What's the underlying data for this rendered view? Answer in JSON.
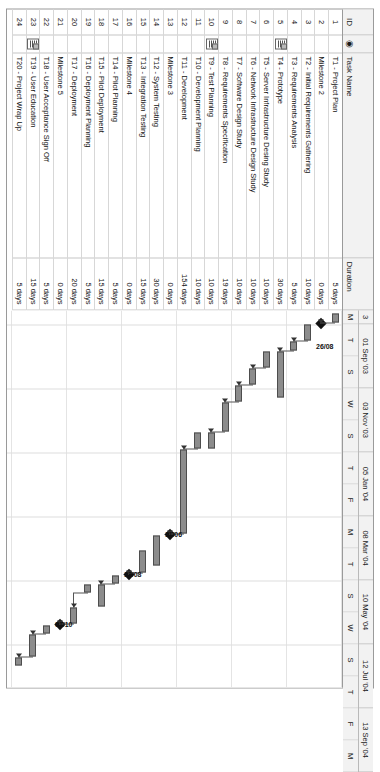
{
  "table": {
    "columns": [
      "ID",
      "indicator-icon",
      "Task Name",
      "Duration"
    ],
    "rows": [
      {
        "id": "1",
        "indicator": "",
        "name": "T1 - Project Plan",
        "duration": "5 days"
      },
      {
        "id": "2",
        "indicator": "",
        "name": "Milestone 2",
        "duration": "0 days"
      },
      {
        "id": "3",
        "indicator": "",
        "name": "T2 - Initial Requirements Gathering",
        "duration": "10 days"
      },
      {
        "id": "4",
        "indicator": "",
        "name": "T3 - Requirements Analysis",
        "duration": "5 days"
      },
      {
        "id": "5",
        "indicator": "note-icon",
        "name": "T4 - Prototype",
        "duration": "30 days"
      },
      {
        "id": "6",
        "indicator": "",
        "name": "T5 - Server Infrastructure Desing Study",
        "duration": "10 days"
      },
      {
        "id": "7",
        "indicator": "",
        "name": "T6 - Network Infrastructure Design Study",
        "duration": "10 days"
      },
      {
        "id": "8",
        "indicator": "",
        "name": "T7 - Software Design Study",
        "duration": "10 days"
      },
      {
        "id": "9",
        "indicator": "",
        "name": "T8 - Requirements Specification",
        "duration": "19 days"
      },
      {
        "id": "10",
        "indicator": "note-icon",
        "name": "T9 - Test Planning",
        "duration": "10 days"
      },
      {
        "id": "11",
        "indicator": "",
        "name": "T10 - Development Planning",
        "duration": "10 days"
      },
      {
        "id": "12",
        "indicator": "",
        "name": "T11 - Development",
        "duration": "154 days"
      },
      {
        "id": "13",
        "indicator": "",
        "name": "Milestone 3",
        "duration": "0 days"
      },
      {
        "id": "14",
        "indicator": "",
        "name": "T12 - System Testing",
        "duration": "30 days"
      },
      {
        "id": "15",
        "indicator": "",
        "name": "T13 - Integration Testing",
        "duration": "15 days"
      },
      {
        "id": "16",
        "indicator": "",
        "name": "Milestone 4",
        "duration": "0 days"
      },
      {
        "id": "17",
        "indicator": "",
        "name": "T14 - Pilot Planning",
        "duration": "5 days"
      },
      {
        "id": "18",
        "indicator": "",
        "name": "T15 - Pilot Deployment",
        "duration": "15 days"
      },
      {
        "id": "19",
        "indicator": "",
        "name": "T16 - Deployment Planning",
        "duration": "5 days"
      },
      {
        "id": "20",
        "indicator": "",
        "name": "T17 - Deployment",
        "duration": "20 days"
      },
      {
        "id": "21",
        "indicator": "",
        "name": "Milestone 5",
        "duration": "0 days"
      },
      {
        "id": "22",
        "indicator": "",
        "name": "T18 - User Acceptance Sign Off",
        "duration": "5 days"
      },
      {
        "id": "23",
        "indicator": "note-icon",
        "name": "T19 - User Education",
        "duration": "15 days"
      },
      {
        "id": "24",
        "indicator": "",
        "name": "T20 - Project Wrap Up",
        "duration": "5 days"
      }
    ]
  },
  "timescale": {
    "major": [
      {
        "label": "3",
        "width": 14
      },
      {
        "label": "01 Sep '03",
        "width": 64
      },
      {
        "label": "03 Nov '03",
        "width": 64
      },
      {
        "label": "05 Jan '04",
        "width": 64
      },
      {
        "label": "08 Mar '04",
        "width": 64
      },
      {
        "label": "10 May '04",
        "width": 64
      },
      {
        "label": "12 Jul '04",
        "width": 64
      },
      {
        "label": "13 Sep '04",
        "width": 64
      }
    ],
    "minor": [
      {
        "label": "M",
        "width": 14
      },
      {
        "label": "T",
        "width": 32
      },
      {
        "label": "S",
        "width": 32
      },
      {
        "label": "W",
        "width": 32
      },
      {
        "label": "S",
        "width": 32
      },
      {
        "label": "T",
        "width": 32
      },
      {
        "label": "F",
        "width": 32
      },
      {
        "label": "M",
        "width": 32
      },
      {
        "label": "T",
        "width": 32
      },
      {
        "label": "S",
        "width": 32
      },
      {
        "label": "W",
        "width": 32
      },
      {
        "label": "S",
        "width": 32
      },
      {
        "label": "T",
        "width": 32
      },
      {
        "label": "F",
        "width": 32
      },
      {
        "label": "M",
        "width": 32
      }
    ]
  },
  "milestone_labels": [
    {
      "text": "26/08",
      "row": 2,
      "x": 34
    },
    {
      "text": "11/06",
      "row": 13,
      "x": 222
    },
    {
      "text": "13/08",
      "row": 16,
      "x": 262
    },
    {
      "text": "01/10",
      "row": 21,
      "x": 312
    }
  ],
  "chart_data": {
    "type": "bar",
    "xlabel": "Timeline (weeks)",
    "ylabel": "Task",
    "categories": [
      "T1 - Project Plan",
      "Milestone 2",
      "T2 - Initial Requirements Gathering",
      "T3 - Requirements Analysis",
      "T4 - Prototype",
      "T5 - Server Infrastructure Desing Study",
      "T6 - Network Infrastructure Design Study",
      "T7 - Software Design Study",
      "T8 - Requirements Specification",
      "T9 - Test Planning",
      "T10 - Development Planning",
      "T11 - Development",
      "Milestone 3",
      "T12 - System Testing",
      "T13 - Integration Testing",
      "Milestone 4",
      "T14 - Pilot Planning",
      "T15 - Pilot Deployment",
      "T16 - Deployment Planning",
      "T17 - Deployment",
      "Milestone 5",
      "T18 - User Acceptance Sign Off",
      "T19 - User Education",
      "T20 - Project Wrap Up"
    ],
    "values": [
      5,
      0,
      10,
      5,
      30,
      10,
      10,
      10,
      19,
      10,
      10,
      154,
      0,
      30,
      15,
      0,
      5,
      15,
      5,
      20,
      0,
      5,
      15,
      5
    ],
    "units": "days",
    "bars": [
      {
        "row": 1,
        "start": 3,
        "len": 9,
        "kind": "task"
      },
      {
        "row": 2,
        "start": 13,
        "len": 0,
        "kind": "milestone"
      },
      {
        "row": 3,
        "start": 14,
        "len": 16,
        "kind": "task"
      },
      {
        "row": 4,
        "start": 31,
        "len": 9,
        "kind": "task"
      },
      {
        "row": 5,
        "start": 41,
        "len": 46,
        "kind": "task"
      },
      {
        "row": 6,
        "start": 41,
        "len": 16,
        "kind": "task"
      },
      {
        "row": 7,
        "start": 58,
        "len": 16,
        "kind": "task"
      },
      {
        "row": 8,
        "start": 75,
        "len": 16,
        "kind": "task"
      },
      {
        "row": 9,
        "start": 92,
        "len": 29,
        "kind": "task"
      },
      {
        "row": 10,
        "start": 122,
        "len": 16,
        "kind": "task"
      },
      {
        "row": 11,
        "start": 122,
        "len": 16,
        "kind": "task"
      },
      {
        "row": 12,
        "start": 139,
        "len": 84,
        "kind": "task"
      },
      {
        "row": 13,
        "start": 224,
        "len": 0,
        "kind": "milestone"
      },
      {
        "row": 14,
        "start": 225,
        "len": 30,
        "kind": "task"
      },
      {
        "row": 15,
        "start": 240,
        "len": 22,
        "kind": "task"
      },
      {
        "row": 16,
        "start": 264,
        "len": 0,
        "kind": "milestone"
      },
      {
        "row": 17,
        "start": 265,
        "len": 8,
        "kind": "task"
      },
      {
        "row": 18,
        "start": 274,
        "len": 22,
        "kind": "task"
      },
      {
        "row": 19,
        "start": 274,
        "len": 8,
        "kind": "task"
      },
      {
        "row": 20,
        "start": 297,
        "len": 16,
        "kind": "task"
      },
      {
        "row": 21,
        "start": 314,
        "len": 0,
        "kind": "milestone"
      },
      {
        "row": 22,
        "start": 315,
        "len": 8,
        "kind": "task"
      },
      {
        "row": 23,
        "start": 324,
        "len": 22,
        "kind": "task"
      },
      {
        "row": 24,
        "start": 347,
        "len": 8,
        "kind": "task"
      }
    ],
    "grid": true,
    "legend": "none"
  }
}
